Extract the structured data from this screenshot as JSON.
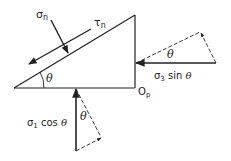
{
  "diagram": {
    "labels": {
      "sigma_n": "σ",
      "sigma_n_sub": "n",
      "tau_n": "τ",
      "tau_n_sub": "n",
      "theta_apex": "θ",
      "theta_right": "θ",
      "theta_bottom": "θ",
      "sigma3_sin": "σ",
      "sigma3_sub": "3",
      "sigma3_rest": " sin ",
      "sigma3_theta": "θ",
      "sigma1_cos": "σ",
      "sigma1_sub": "1",
      "sigma1_rest": " cos ",
      "sigma1_theta": "θ",
      "origin": "O",
      "origin_sub": "p"
    },
    "colors": {
      "line": "#222222",
      "background": "#ffffff"
    }
  }
}
